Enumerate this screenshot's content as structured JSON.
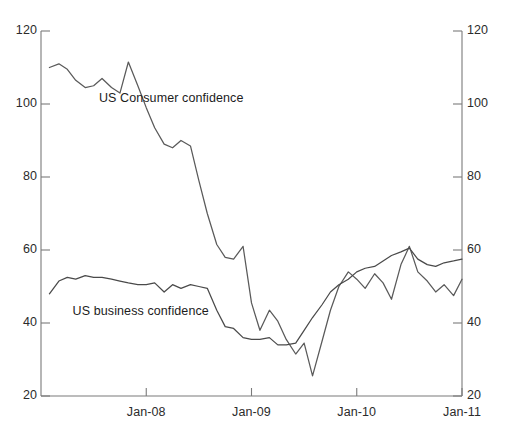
{
  "chart_data": {
    "type": "line",
    "title": "",
    "subtitle": "",
    "xlabel": "",
    "ylabel": "",
    "grid": false,
    "legend_position": "inline-annotations",
    "xlim_labels": [
      "Jan-08",
      "Jan-09",
      "Jan-10",
      "Jan-11"
    ],
    "xticks": [
      "Jan-08",
      "Jan-09",
      "Jan-10",
      "Jan-11"
    ],
    "xtick_values": [
      2008.0,
      2009.0,
      2010.0,
      2011.0
    ],
    "ylim": [
      20,
      120
    ],
    "yticks": [
      20,
      40,
      60,
      80,
      100,
      120
    ],
    "yticks_left": [
      "20",
      "40",
      "60",
      "80",
      "100",
      "120"
    ],
    "yticks_right": [
      "20",
      "40",
      "60",
      "80",
      "100",
      "120"
    ],
    "x_start": 2007.08,
    "x_end": 2011.0,
    "series": [
      {
        "name": "US Consumer confidence",
        "color": "#5a5a5a",
        "label_x": 2007.55,
        "label_y": 101.5,
        "x": [
          2007.08,
          2007.17,
          2007.25,
          2007.33,
          2007.42,
          2007.5,
          2007.58,
          2007.67,
          2007.75,
          2007.83,
          2007.92,
          2008.0,
          2008.08,
          2008.17,
          2008.25,
          2008.33,
          2008.42,
          2008.5,
          2008.58,
          2008.67,
          2008.75,
          2008.83,
          2008.92,
          2009.0,
          2009.08,
          2009.17,
          2009.25,
          2009.33,
          2009.42,
          2009.5,
          2009.58,
          2009.67,
          2009.75,
          2009.83,
          2009.92,
          2010.0,
          2010.08,
          2010.17,
          2010.25,
          2010.33,
          2010.42,
          2010.5,
          2010.58,
          2010.67,
          2010.75,
          2010.83,
          2010.92,
          2011.0
        ],
        "values": [
          110.0,
          111.0,
          109.5,
          106.5,
          104.5,
          105.0,
          107.0,
          104.5,
          103.0,
          111.5,
          105.0,
          99.0,
          93.5,
          89.0,
          88.0,
          90.0,
          88.5,
          79.0,
          70.0,
          61.5,
          58.0,
          57.5,
          61.0,
          45.5,
          38.0,
          43.5,
          40.5,
          35.5,
          31.5,
          34.5,
          25.5,
          35.0,
          43.5,
          50.0,
          54.0,
          52.0,
          49.5,
          53.5,
          51.0,
          46.5,
          56.0,
          61.0,
          54.0,
          51.5,
          48.5,
          50.5,
          47.5,
          52.0
        ]
      },
      {
        "name": "US business confidence",
        "color": "#4a4a4a",
        "label_x": 2007.3,
        "label_y": 43.0,
        "x": [
          2007.08,
          2007.17,
          2007.25,
          2007.33,
          2007.42,
          2007.5,
          2007.58,
          2007.67,
          2007.75,
          2007.83,
          2007.92,
          2008.0,
          2008.08,
          2008.17,
          2008.25,
          2008.33,
          2008.42,
          2008.5,
          2008.58,
          2008.67,
          2008.75,
          2008.83,
          2008.92,
          2009.0,
          2009.08,
          2009.17,
          2009.25,
          2009.33,
          2009.42,
          2009.5,
          2009.58,
          2009.67,
          2009.75,
          2009.83,
          2009.92,
          2010.0,
          2010.08,
          2010.17,
          2010.25,
          2010.33,
          2010.42,
          2010.5,
          2010.58,
          2010.67,
          2010.75,
          2010.83,
          2010.92,
          2011.0
        ],
        "values": [
          48.0,
          51.5,
          52.5,
          52.0,
          53.0,
          52.5,
          52.5,
          52.0,
          51.5,
          51.0,
          50.5,
          50.5,
          51.0,
          48.5,
          50.5,
          49.5,
          50.5,
          50.0,
          49.5,
          43.5,
          39.0,
          38.5,
          36.0,
          35.5,
          35.5,
          36.0,
          34.0,
          34.0,
          34.5,
          38.0,
          41.5,
          45.0,
          48.5,
          50.5,
          52.0,
          54.0,
          55.0,
          55.5,
          57.0,
          58.5,
          59.5,
          60.5,
          57.5,
          56.0,
          55.5,
          56.5,
          57.0,
          57.5
        ]
      }
    ]
  }
}
